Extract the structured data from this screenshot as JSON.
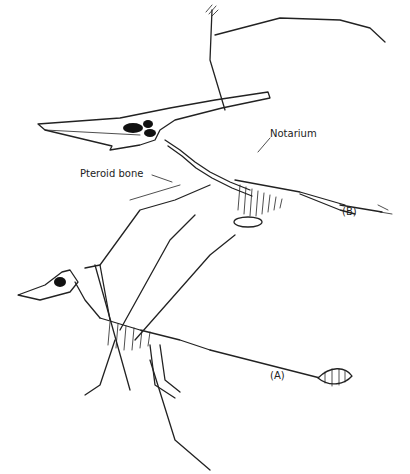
{
  "figure": {
    "labels": {
      "notarium": "Notarium",
      "pteroid_bone": "Pteroid bone",
      "specimen_b": "(B)",
      "specimen_a": "(A)"
    },
    "colors": {
      "line": "#222222",
      "background": "#ffffff"
    },
    "specimens": [
      {
        "id": "B",
        "description": "Large crested pterodactyloid skeleton, wings spread (upper)"
      },
      {
        "id": "A",
        "description": "Long-tailed rhamphorhynchoid skeleton with tail vane (lower)"
      }
    ]
  }
}
